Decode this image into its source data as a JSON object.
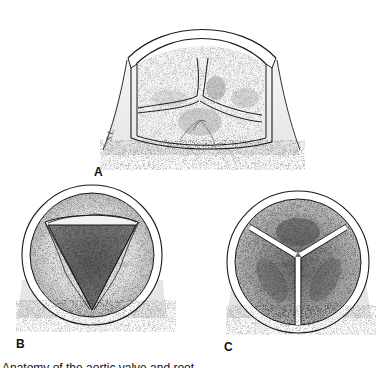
{
  "figure": {
    "panels": [
      {
        "id": "A",
        "label": "A",
        "view": "opened aortic root with three cusps (cutaway)"
      },
      {
        "id": "B",
        "label": "B",
        "view": "valve open, triangular orifice (top view)"
      },
      {
        "id": "C",
        "label": "C",
        "view": "valve closed, three coapting cusps (top view)"
      }
    ],
    "signature": "S.L.",
    "caption_partial": "Anatomy of the aortic valve and root ..."
  },
  "colors": {
    "ink": "#1a1a1a",
    "stipple_light": "#d9d9d9",
    "stipple_mid": "#a8a8a8",
    "stipple_dark": "#6a6a6a",
    "background": "#ffffff"
  }
}
